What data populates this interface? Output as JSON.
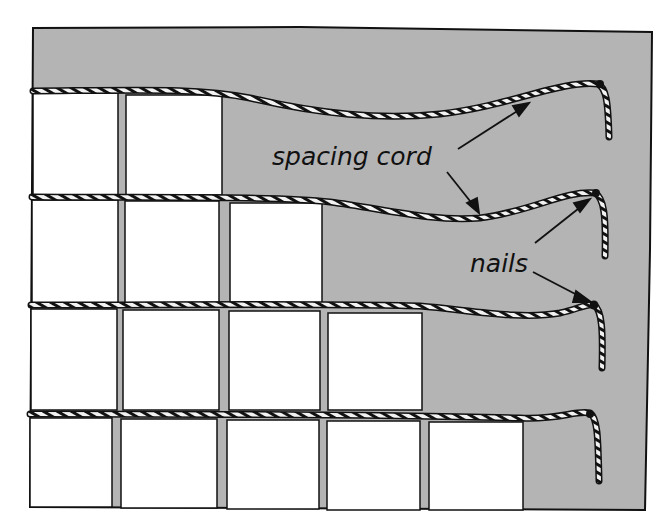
{
  "diagram": {
    "labels": {
      "spacing_cord": "spacing cord",
      "nails": "nails"
    },
    "colors": {
      "background": "#ffffff",
      "board": "#b4b4b4",
      "tile": "#ffffff",
      "outline": "#111111",
      "cord_light": "#f2f2f2"
    },
    "rows": [
      {
        "row": 1,
        "tiles_laid": 2
      },
      {
        "row": 2,
        "tiles_laid": 3
      },
      {
        "row": 3,
        "tiles_laid": 4
      },
      {
        "row": 4,
        "tiles_laid": 5
      }
    ],
    "cord_count": 4,
    "nail_count": 4
  }
}
